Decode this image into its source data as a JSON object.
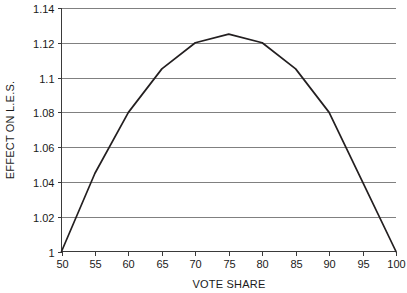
{
  "chart_data": {
    "type": "line",
    "title": "",
    "xlabel": "VOTE SHARE",
    "ylabel": "EFFECT ON L.E.S.",
    "xlim": [
      50,
      100
    ],
    "ylim": [
      1,
      1.14
    ],
    "grid": "horizontal",
    "legend": "none",
    "x": [
      50,
      55,
      60,
      65,
      70,
      75,
      80,
      85,
      90,
      95,
      100
    ],
    "values": [
      1.0,
      1.045,
      1.08,
      1.105,
      1.12,
      1.125,
      1.12,
      1.105,
      1.08,
      1.04,
      1.0
    ],
    "series": [
      {
        "name": "Effect on L.E.S.",
        "values": [
          1.0,
          1.045,
          1.08,
          1.105,
          1.12,
          1.125,
          1.12,
          1.105,
          1.08,
          1.04,
          1.0
        ],
        "color": "#231f20"
      }
    ],
    "x_tick_labels": [
      "50",
      "55",
      "60",
      "65",
      "70",
      "75",
      "80",
      "85",
      "90",
      "95",
      "100"
    ],
    "y_tick_labels": [
      "1",
      "1.02",
      "1.04",
      "1.06",
      "1.08",
      "1.1",
      "1.12",
      "1.14"
    ],
    "y_tick_values": [
      1,
      1.02,
      1.04,
      1.06,
      1.08,
      1.1,
      1.12,
      1.14
    ],
    "colors": {
      "line": "#231f20",
      "grid": "#808080",
      "axis": "#3a3a3a",
      "background": "#ffffff",
      "text": "#1a1a1a"
    }
  }
}
